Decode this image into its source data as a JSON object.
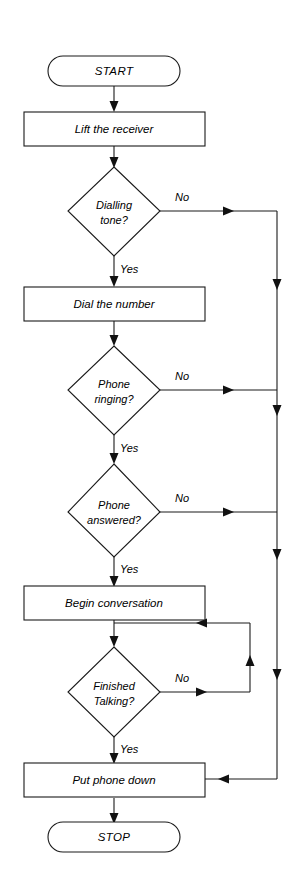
{
  "diagram": {
    "type": "flowchart",
    "orientation": "vertical",
    "colors": {
      "background": "#ffffff",
      "stroke": "#1a1a1a",
      "text": "#000000",
      "arrow_fill": "#111111"
    },
    "nodes": [
      {
        "id": "start",
        "shape": "terminator",
        "label": "START",
        "line1": "START",
        "line2": ""
      },
      {
        "id": "lift-receiver",
        "shape": "process",
        "label": "Lift the receiver",
        "line1": "Lift the receiver",
        "line2": ""
      },
      {
        "id": "dialling-tone",
        "shape": "decision",
        "label": "Dialling tone?",
        "line1": "Dialling",
        "line2": "tone?"
      },
      {
        "id": "dial-number",
        "shape": "process",
        "label": "Dial the number",
        "line1": "Dial the number",
        "line2": ""
      },
      {
        "id": "phone-ringing",
        "shape": "decision",
        "label": "Phone ringing?",
        "line1": "Phone",
        "line2": "ringing?"
      },
      {
        "id": "phone-answered",
        "shape": "decision",
        "label": "Phone answered?",
        "line1": "Phone",
        "line2": "answered?"
      },
      {
        "id": "begin-conversation",
        "shape": "process",
        "label": "Begin conversation",
        "line1": "Begin conversation",
        "line2": ""
      },
      {
        "id": "finished-talking",
        "shape": "decision",
        "label": "Finished Talking?",
        "line1": "Finished",
        "line2": "Talking?"
      },
      {
        "id": "put-phone-down",
        "shape": "process",
        "label": "Put phone down",
        "line1": "Put phone down",
        "line2": ""
      },
      {
        "id": "stop",
        "shape": "terminator",
        "label": "STOP",
        "line1": "STOP",
        "line2": ""
      }
    ],
    "edge_labels": {
      "dialling_tone_no": "No",
      "dialling_tone_yes": "Yes",
      "phone_ringing_no": "No",
      "phone_ringing_yes": "Yes",
      "phone_answered_no": "No",
      "phone_answered_yes": "Yes",
      "finished_talking_no": "No",
      "finished_talking_yes": "Yes"
    }
  }
}
